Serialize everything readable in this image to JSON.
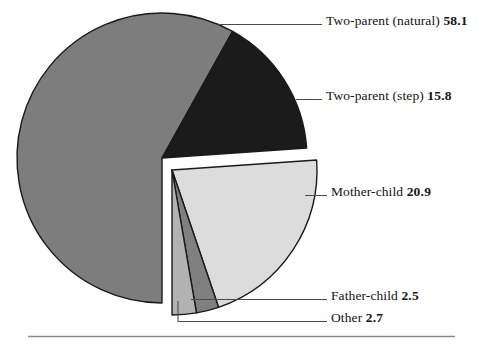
{
  "chart_data": {
    "type": "pie",
    "title": "",
    "subtitle": "",
    "xlabel": "",
    "ylabel": "",
    "legend_position": "callout-labels-right",
    "grid": false,
    "units": "percent",
    "categories": [
      "Two-parent (natural)",
      "Two-parent (step)",
      "Mother-child",
      "Father-child",
      "Other"
    ],
    "values": [
      58.1,
      15.8,
      20.9,
      2.5,
      2.7
    ],
    "colors": [
      "#7d7d7d",
      "#1b1b1b",
      "#dcdcdc",
      "#808080",
      "#b2b2b2"
    ],
    "slices": [
      {
        "label": "Two-parent (natural)",
        "value": 58.1,
        "color": "#7d7d7d",
        "exploded": false
      },
      {
        "label": "Two-parent (step)",
        "value": 15.8,
        "color": "#1b1b1b",
        "exploded": false
      },
      {
        "label": "Mother-child",
        "value": 20.9,
        "color": "#dcdcdc",
        "exploded": true
      },
      {
        "label": "Father-child",
        "value": 2.5,
        "color": "#808080",
        "exploded": true
      },
      {
        "label": "Other",
        "value": 2.7,
        "color": "#b2b2b2",
        "exploded": true
      }
    ]
  },
  "callouts": {
    "two_parent_natural": {
      "label": "Two-parent (natural)",
      "value": "58.1"
    },
    "two_parent_step": {
      "label": "Two-parent (step)",
      "value": "15.8"
    },
    "mother_child": {
      "label": "Mother-child",
      "value": "20.9"
    },
    "father_child": {
      "label": "Father-child",
      "value": "2.5"
    },
    "other": {
      "label": "Other",
      "value": "2.7"
    }
  },
  "style": {
    "background": "#ffffff",
    "outline": "#1a1a1a",
    "rule_color": "#8a8a8a"
  }
}
